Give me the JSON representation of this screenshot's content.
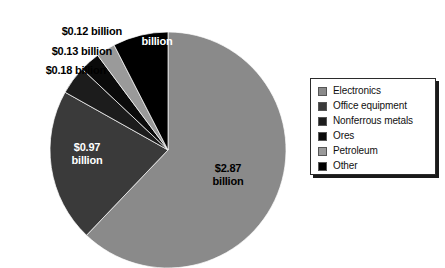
{
  "chart_data": {
    "type": "pie",
    "title": "",
    "units": "billion US dollars",
    "value_prefix": "$",
    "total": 4.62,
    "legend_position": "right",
    "grid": false,
    "start_angle_deg": 0,
    "direction": "clockwise",
    "categories": [
      "Electronics",
      "Office equipment",
      "Nonferrous metals",
      "Ores",
      "Petroleum",
      "Other"
    ],
    "values": [
      2.87,
      0.97,
      0.18,
      0.13,
      0.12,
      0.35
    ],
    "colors": [
      "#8a8a8a",
      "#3a3a3a",
      "#1c1c1c",
      "#0a0a0a",
      "#9a9a9a",
      "#000000"
    ],
    "slices": [
      {
        "name": "Electronics",
        "value": 2.87,
        "label": "$2.87\nbillion",
        "color": "#8a8a8a",
        "label_placement": "inside",
        "label_color": "#000000",
        "start_deg": 0,
        "sweep_deg": 223.7
      },
      {
        "name": "Office equipment",
        "value": 0.97,
        "label": "$0.97\nbillion",
        "color": "#3a3a3a",
        "label_placement": "inside",
        "label_color": "#ffffff",
        "start_deg": 223.7,
        "sweep_deg": 75.6
      },
      {
        "name": "Nonferrous metals",
        "value": 0.18,
        "label": "$0.18 billion",
        "color": "#1c1c1c",
        "label_placement": "outside",
        "label_color": "#000000",
        "start_deg": 299.3,
        "sweep_deg": 14.0
      },
      {
        "name": "Ores",
        "value": 0.13,
        "label": "$0.13 billion",
        "color": "#0a0a0a",
        "label_placement": "outside",
        "label_color": "#000000",
        "start_deg": 313.3,
        "sweep_deg": 10.1
      },
      {
        "name": "Petroleum",
        "value": 0.12,
        "label": "$0.12 billion",
        "color": "#9a9a9a",
        "label_placement": "outside",
        "label_color": "#000000",
        "start_deg": 323.4,
        "sweep_deg": 9.4
      },
      {
        "name": "Other",
        "value": 0.35,
        "label": "$0.35\nbillion",
        "color": "#000000",
        "label_placement": "inside",
        "label_color": "#ffffff",
        "start_deg": 332.8,
        "sweep_deg": 27.2
      }
    ]
  },
  "labels": {
    "electronics": "$2.87\nbillion",
    "office_equipment": "$0.97\nbillion",
    "nonferrous_metals": "$0.18 billion",
    "ores": "$0.13 billion",
    "petroleum": "$0.12 billion",
    "other": "$0.35\nbillion"
  },
  "legend": {
    "items": [
      {
        "label": "Electronics",
        "color": "#8a8a8a"
      },
      {
        "label": "Office equipment",
        "color": "#3a3a3a"
      },
      {
        "label": "Nonferrous metals",
        "color": "#1c1c1c"
      },
      {
        "label": "Ores",
        "color": "#0a0a0a"
      },
      {
        "label": "Petroleum",
        "color": "#9a9a9a"
      },
      {
        "label": "Other",
        "color": "#000000"
      }
    ]
  }
}
